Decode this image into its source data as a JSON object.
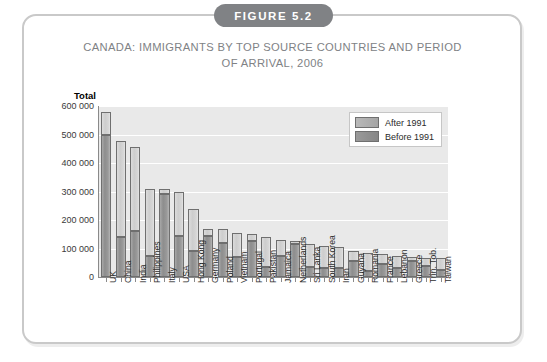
{
  "figure": {
    "badge_label": "FIGURE 5.2",
    "title_line1": "CANADA: IMMIGRANTS BY TOP SOURCE COUNTRIES AND PERIOD",
    "title_line2": "OF ARRIVAL, 2006"
  },
  "colors": {
    "badge_bg": "#808285",
    "title_text": "#808285",
    "frame_border": "#c9c9c9",
    "plot_bg": "#e9e9e9",
    "gridline": "#ffffff",
    "axis": "#8a8a8a",
    "series_after_1991": "#d4d4d4",
    "series_before_1991": "#999999"
  },
  "chart_data": {
    "type": "bar",
    "stacked": true,
    "title": "CANADA: IMMIGRANTS BY TOP SOURCE COUNTRIES AND PERIOD OF ARRIVAL, 2006",
    "xlabel": "",
    "ylabel": "Total",
    "ylim": [
      0,
      600000
    ],
    "yticks": [
      0,
      100000,
      200000,
      300000,
      400000,
      500000,
      600000
    ],
    "ytick_labels": [
      "0",
      "100 000",
      "200 000",
      "300 000",
      "400 000",
      "500 000",
      "600 000"
    ],
    "grid": true,
    "legend_position": "top-right-inside",
    "categories": [
      "UK",
      "China",
      "India",
      "Philippines",
      "Italy",
      "USA",
      "Hong Kong",
      "Germany",
      "Poland",
      "Vietnam",
      "Portugal",
      "Pakistan",
      "Jamaica",
      "Netherlands",
      "Sri Lanka",
      "South Korea",
      "Iran",
      "Guyana",
      "Romania",
      "France",
      "Lebanon",
      "Greece",
      "Trin. Tob.",
      "Taiwan"
    ],
    "series": [
      {
        "name": "Before 1991",
        "values": [
          500000,
          140000,
          160000,
          75000,
          290000,
          145000,
          90000,
          145000,
          120000,
          70000,
          125000,
          35000,
          75000,
          115000,
          35000,
          30000,
          30000,
          55000,
          20000,
          45000,
          30000,
          55000,
          40000,
          25000
        ]
      },
      {
        "name": "After 1991",
        "values": [
          80000,
          338000,
          295000,
          235000,
          20000,
          155000,
          150000,
          25000,
          50000,
          85000,
          25000,
          105000,
          55000,
          10000,
          80000,
          80000,
          75000,
          35000,
          65000,
          35000,
          45000,
          15000,
          25000,
          40000
        ]
      }
    ],
    "totals": [
      580000,
      478000,
      455000,
      310000,
      310000,
      300000,
      240000,
      170000,
      170000,
      155000,
      150000,
      140000,
      130000,
      125000,
      115000,
      110000,
      105000,
      90000,
      85000,
      80000,
      75000,
      70000,
      65000,
      65000
    ]
  },
  "legend": {
    "items": [
      {
        "label": "After 1991",
        "swatch": "sw-after"
      },
      {
        "label": "Before 1991",
        "swatch": "sw-before"
      }
    ]
  }
}
